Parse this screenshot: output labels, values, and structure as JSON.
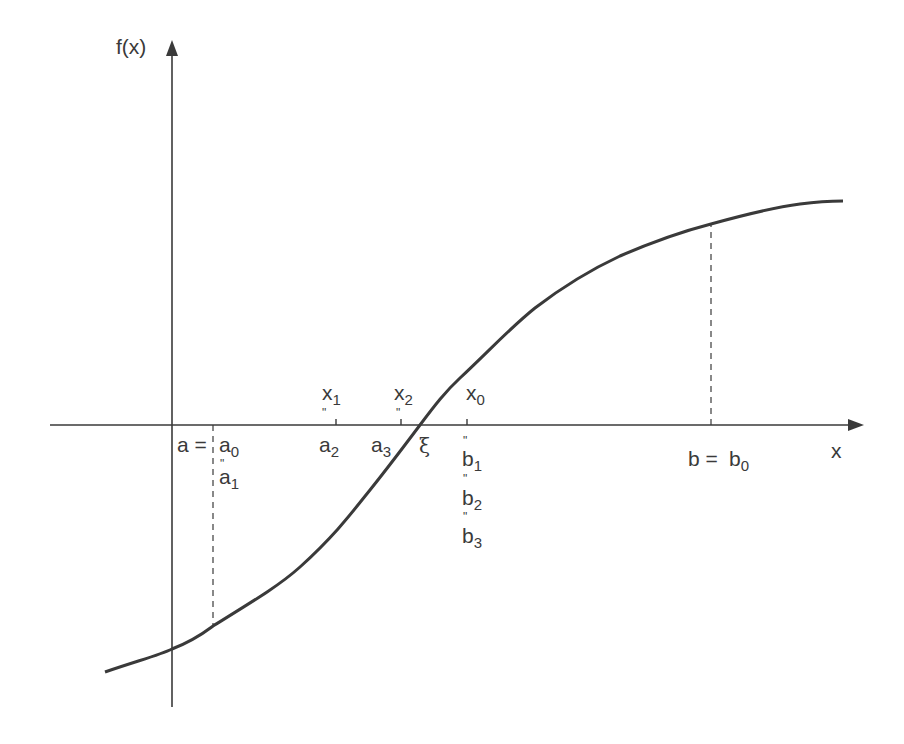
{
  "figure": {
    "type": "bisection-method-diagram",
    "colors": {
      "ink": "#3a3a3a",
      "background": "#ffffff"
    },
    "axes": {
      "y_label": "f(x)",
      "x_label": "x"
    },
    "labels": {
      "a_eq": "a =",
      "a0": {
        "base": "a",
        "sub": "0"
      },
      "a1": {
        "base": "a",
        "sub": "1"
      },
      "a2": {
        "base": "a",
        "sub": "2"
      },
      "a3": {
        "base": "a",
        "sub": "3"
      },
      "x1": {
        "base": "x",
        "sub": "1"
      },
      "x2": {
        "base": "x",
        "sub": "2"
      },
      "x0": {
        "base": "x",
        "sub": "0"
      },
      "xi": "ξ",
      "b1": {
        "base": "b",
        "sub": "1"
      },
      "b2": {
        "base": "b",
        "sub": "2"
      },
      "b3": {
        "base": "b",
        "sub": "3"
      },
      "b_eq": "b =",
      "b0": {
        "base": "b",
        "sub": "0"
      },
      "equals_mark": "\""
    }
  }
}
